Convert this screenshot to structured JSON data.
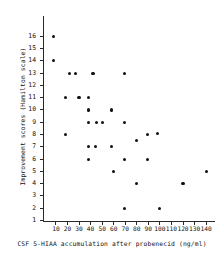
{
  "chart_data": {
    "type": "scatter",
    "title": "",
    "xlabel": "CSF 5-HIAA accumulation after probenecid (ng/ml)",
    "ylabel": "Improvement scores (Hamilton scale)",
    "xlim": [
      0,
      147
    ],
    "ylim": [
      0,
      16.8
    ],
    "grid": false,
    "legend": null,
    "xticks": [
      10,
      20,
      30,
      40,
      50,
      60,
      70,
      80,
      90,
      100,
      110,
      120,
      130,
      140
    ],
    "xtick_labels": [
      "10",
      "20",
      "30",
      "40",
      "50",
      "60",
      "70",
      "80",
      "90",
      "100",
      "110",
      "120",
      "130",
      "140"
    ],
    "yticks": [
      1,
      2,
      3,
      4,
      5,
      6,
      7,
      8,
      9,
      10,
      11,
      12,
      13,
      14,
      15,
      16
    ],
    "ytick_labels": [
      "1",
      "2",
      "3",
      "4",
      "5",
      "6",
      "7",
      "8",
      "9",
      "10",
      "11",
      "12",
      "13",
      "14",
      "15",
      "16"
    ],
    "marker": "filled-circle",
    "marker_color": "#111111",
    "points": [
      {
        "x": 8,
        "y": 16
      },
      {
        "x": 8,
        "y": 14
      },
      {
        "x": 18,
        "y": 11
      },
      {
        "x": 18,
        "y": 8
      },
      {
        "x": 22,
        "y": 13
      },
      {
        "x": 27,
        "y": 13
      },
      {
        "x": 30,
        "y": 11
      },
      {
        "x": 38,
        "y": 11
      },
      {
        "x": 38,
        "y": 10
      },
      {
        "x": 38,
        "y": 9
      },
      {
        "x": 38,
        "y": 7
      },
      {
        "x": 38,
        "y": 6
      },
      {
        "x": 42,
        "y": 13
      },
      {
        "x": 44,
        "y": 7
      },
      {
        "x": 45,
        "y": 9
      },
      {
        "x": 50,
        "y": 9
      },
      {
        "x": 58,
        "y": 10
      },
      {
        "x": 58,
        "y": 7
      },
      {
        "x": 60,
        "y": 5
      },
      {
        "x": 69,
        "y": 13
      },
      {
        "x": 69,
        "y": 9
      },
      {
        "x": 69,
        "y": 6
      },
      {
        "x": 69,
        "y": 2
      },
      {
        "x": 80,
        "y": 7.5
      },
      {
        "x": 80,
        "y": 4
      },
      {
        "x": 89,
        "y": 8
      },
      {
        "x": 89,
        "y": 6
      },
      {
        "x": 98,
        "y": 8.1
      },
      {
        "x": 100,
        "y": 2
      },
      {
        "x": 120,
        "y": 4
      },
      {
        "x": 140,
        "y": 5
      }
    ]
  },
  "axes": {
    "y_axis_name": "improvement-score-axis",
    "x_axis_name": "csf-5hiaa-axis"
  }
}
